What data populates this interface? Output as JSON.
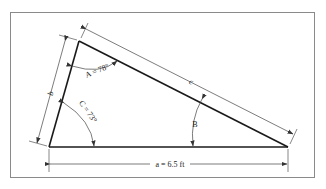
{
  "figure": {
    "sides": {
      "a": {
        "label": "a = 6.5 ft",
        "value_ft": 6.5
      },
      "b": {
        "label": "b"
      },
      "c": {
        "label": "c"
      }
    },
    "angles": {
      "A": {
        "label": "A = 78°",
        "value_deg": 78
      },
      "B": {
        "label": "B"
      },
      "C": {
        "label": "C = 73°",
        "value_deg": 73
      }
    },
    "colors": {
      "line": "#1a1a1a",
      "dimension": "#444444",
      "frame": "#888888"
    }
  }
}
